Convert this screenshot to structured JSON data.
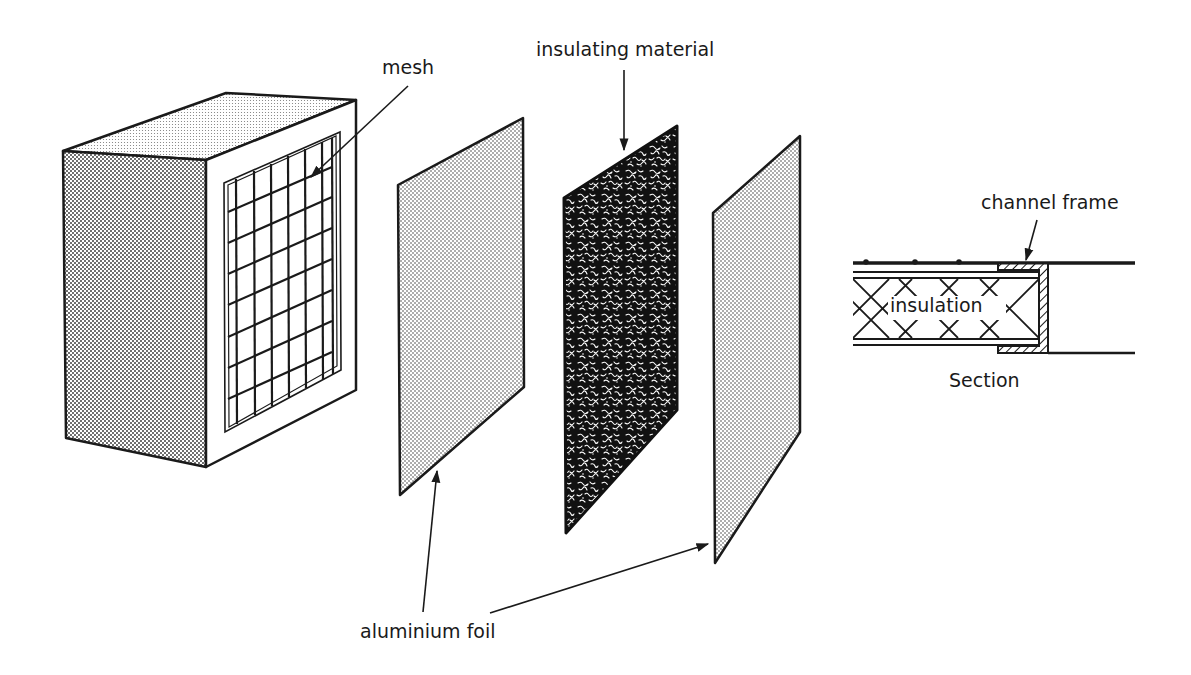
{
  "figure": {
    "colors": {
      "ink": "#1a1a1a",
      "background": "#ffffff",
      "stipple": "#2a2a2a"
    }
  },
  "components": [
    {
      "id": "box",
      "name": "Box frame with mesh front"
    },
    {
      "id": "foil-1",
      "name": "Aluminium foil sheet (front)"
    },
    {
      "id": "insulation-panel",
      "name": "Insulating material panel"
    },
    {
      "id": "foil-2",
      "name": "Aluminium foil sheet (back)"
    },
    {
      "id": "section",
      "name": "Section detail"
    }
  ],
  "labels": {
    "mesh": "mesh",
    "insulating_material": "insulating material",
    "aluminium_foil": "aluminium foil",
    "channel_frame": "channel frame",
    "insulation": "insulation",
    "section": "Section"
  }
}
